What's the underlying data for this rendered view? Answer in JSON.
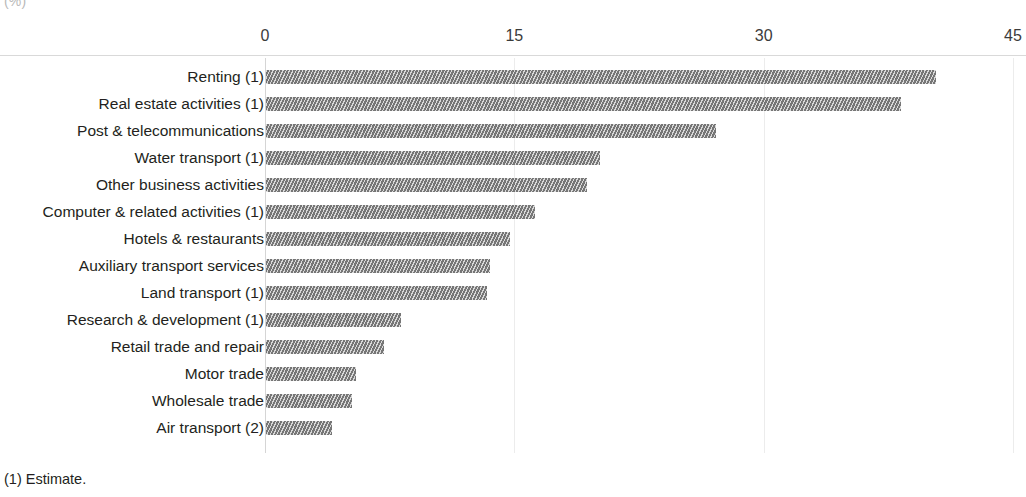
{
  "units_label": "(%)",
  "footnotes": [
    "(1) Estimate."
  ],
  "chart_data": {
    "type": "bar",
    "orientation": "horizontal",
    "title": "",
    "subtitle": "",
    "xlabel": "(%)",
    "ylabel": "",
    "xlim": [
      0,
      45
    ],
    "xticks": [
      "0",
      "15",
      "30",
      "45"
    ],
    "xtick_values": [
      0,
      15,
      30,
      45
    ],
    "grid": true,
    "legend": false,
    "series_color": "#767676",
    "bar_fill": "diagonal-hatch-gray",
    "categories": [
      "Renting (1)",
      "Real estate activities (1)",
      "Post & telecommunications",
      "Water transport (1)",
      "Other business activities",
      "Computer & related activities (1)",
      "Hotels & restaurants",
      "Auxiliary transport services",
      "Land transport (1)",
      "Research & development (1)",
      "Retail trade and repair",
      "Motor trade",
      "Wholesale trade",
      "Air transport (2)"
    ],
    "values": [
      40.3,
      38.2,
      27.1,
      20.1,
      19.3,
      16.2,
      14.7,
      13.5,
      13.3,
      8.1,
      7.1,
      5.4,
      5.2,
      4.0
    ]
  }
}
